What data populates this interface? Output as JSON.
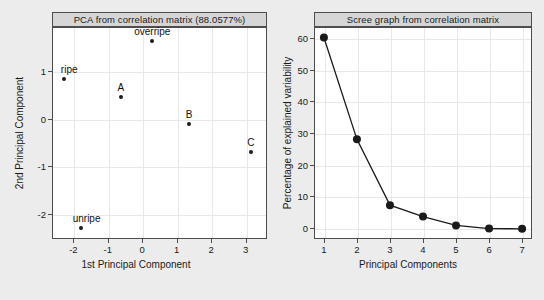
{
  "figure": {
    "background_color": "#ececec",
    "panel_background": "#ffffff",
    "strip_background": "#d6d6d6",
    "marker_color": "#1a1a1a",
    "grid_color": "#e8e8e8"
  },
  "panels": {
    "left": {
      "title": "PCA from correlation matrix (88.0577%)",
      "xlabel": "1st Principal Component",
      "ylabel": "2nd Principal Component",
      "xticks": [
        "-2",
        "-1",
        "0",
        "1",
        "2",
        "3"
      ],
      "yticks": [
        "1",
        "0",
        "-1",
        "-2"
      ]
    },
    "right": {
      "title": "Scree graph from correlation matrix",
      "xlabel": "Principal Components",
      "ylabel": "Percentage of explained variability",
      "xticks": [
        "1",
        "2",
        "3",
        "4",
        "5",
        "6",
        "7"
      ],
      "yticks": [
        "0",
        "10",
        "20",
        "30",
        "40",
        "50",
        "60"
      ]
    }
  },
  "chart_data": [
    {
      "type": "scatter",
      "title": "PCA from correlation matrix (88.0577%)",
      "xlabel": "1st Principal Component",
      "ylabel": "2nd Principal Component",
      "xlim": [
        -2.62,
        3.62
      ],
      "ylim": [
        -2.52,
        1.92
      ],
      "xticks": [
        -2,
        -1,
        0,
        1,
        2,
        3
      ],
      "yticks": [
        1,
        0,
        -1,
        -2
      ],
      "grid": true,
      "legend": "none",
      "points": [
        {
          "label": "ripe",
          "x": -2.28,
          "y": 0.83,
          "label_dx": 0.12,
          "label_dy": 0.3
        },
        {
          "label": "unripe",
          "x": -1.78,
          "y": -2.28,
          "label_dx": 0.1,
          "label_dy": 0.3
        },
        {
          "label": "overripe",
          "x": 0.29,
          "y": 1.62,
          "label_dx": 0.0,
          "label_dy": 0.3
        },
        {
          "label": "A",
          "x": -0.62,
          "y": 0.46,
          "label_dx": 0.0,
          "label_dy": 0.3
        },
        {
          "label": "B",
          "x": 1.36,
          "y": -0.12,
          "label_dx": 0.0,
          "label_dy": 0.3
        },
        {
          "label": "C",
          "x": 3.15,
          "y": -0.7,
          "label_dx": 0.0,
          "label_dy": 0.3
        }
      ]
    },
    {
      "type": "line",
      "title": "Scree graph from correlation matrix",
      "xlabel": "Principal Components",
      "ylabel": "Percentage of explained variability",
      "xlim": [
        0.7,
        7.3
      ],
      "ylim": [
        -3.5,
        63.5
      ],
      "xticks": [
        1,
        2,
        3,
        4,
        5,
        6,
        7
      ],
      "yticks": [
        0,
        10,
        20,
        30,
        40,
        50,
        60
      ],
      "grid": true,
      "legend": "none",
      "categories": [
        1,
        2,
        3,
        4,
        5,
        6,
        7
      ],
      "values": [
        60.2,
        28.0,
        7.2,
        3.6,
        0.8,
        -0.2,
        -0.3
      ]
    }
  ]
}
